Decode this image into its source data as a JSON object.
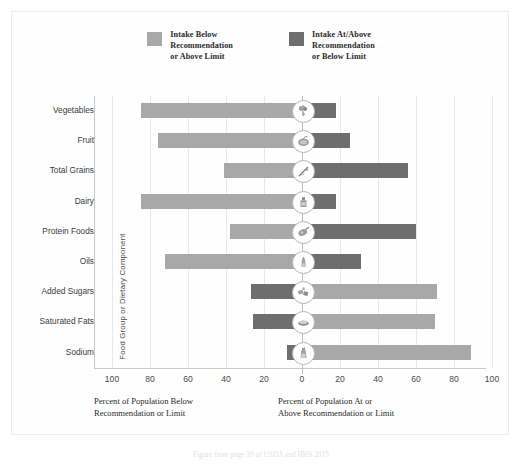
{
  "legend": {
    "items": [
      {
        "label": "Intake Below\nRecommendation\nor Above Limit",
        "color": "#a8a8a8",
        "key": "below"
      },
      {
        "label": "Intake At/Above\nRecommendation\nor Below Limit",
        "color": "#6e6e6e",
        "key": "at_above"
      }
    ]
  },
  "axes": {
    "y_title": "Food Group or Dietary Component",
    "x_ticks": [
      "100",
      "80",
      "60",
      "40",
      "20",
      "0",
      "20",
      "40",
      "60",
      "80",
      "100"
    ],
    "caption_left": "Percent of Population Below\nRecommendation or Limit",
    "caption_right": "Percent of Population At or\nAbove Recommendation or Limit"
  },
  "figcaption": "Figure from page 39 of USDA and HHS 2015",
  "chart_data": {
    "type": "bar",
    "orientation": "horizontal",
    "subtype": "diverging-bar",
    "title": "",
    "xlabel": "Percent of Population",
    "ylabel": "Food Group or Dietary Component",
    "xlim": [
      -100,
      100
    ],
    "grid": true,
    "legend_position": "top",
    "categories": [
      "Vegetables",
      "Fruit",
      "Total Grains",
      "Dairy",
      "Protein Foods",
      "Oils",
      "Added Sugars",
      "Saturated Fats",
      "Sodium"
    ],
    "series": [
      {
        "name": "Intake Below Recommendation or Above Limit",
        "color": "#a8a8a8",
        "side": "varies",
        "values": [
          85,
          76,
          41,
          85,
          38,
          72,
          71,
          70,
          89
        ]
      },
      {
        "name": "Intake At/Above Recommendation or Below Limit",
        "color": "#6e6e6e",
        "side": "varies",
        "values": [
          18,
          25,
          56,
          18,
          60,
          31,
          27,
          26,
          8
        ]
      }
    ],
    "rows": [
      {
        "category": "Vegetables",
        "left": 85,
        "right": 18,
        "left_color": "#a8a8a8",
        "right_color": "#6e6e6e",
        "icon": "broccoli-icon"
      },
      {
        "category": "Fruit",
        "left": 76,
        "right": 25,
        "left_color": "#a8a8a8",
        "right_color": "#6e6e6e",
        "icon": "fruit-icon"
      },
      {
        "category": "Total Grains",
        "left": 41,
        "right": 56,
        "left_color": "#a8a8a8",
        "right_color": "#6e6e6e",
        "icon": "grain-icon"
      },
      {
        "category": "Dairy",
        "left": 85,
        "right": 18,
        "left_color": "#a8a8a8",
        "right_color": "#6e6e6e",
        "icon": "dairy-icon"
      },
      {
        "category": "Protein Foods",
        "left": 38,
        "right": 60,
        "left_color": "#a8a8a8",
        "right_color": "#6e6e6e",
        "icon": "protein-icon"
      },
      {
        "category": "Oils",
        "left": 72,
        "right": 31,
        "left_color": "#a8a8a8",
        "right_color": "#6e6e6e",
        "icon": "oils-icon"
      },
      {
        "category": "Added Sugars",
        "left": 27,
        "right": 71,
        "left_color": "#6e6e6e",
        "right_color": "#a8a8a8",
        "icon": "added-sugars-icon"
      },
      {
        "category": "Saturated Fats",
        "left": 26,
        "right": 70,
        "left_color": "#6e6e6e",
        "right_color": "#a8a8a8",
        "icon": "saturated-fats-icon"
      },
      {
        "category": "Sodium",
        "left": 8,
        "right": 89,
        "left_color": "#6e6e6e",
        "right_color": "#a8a8a8",
        "icon": "sodium-icon"
      }
    ]
  }
}
